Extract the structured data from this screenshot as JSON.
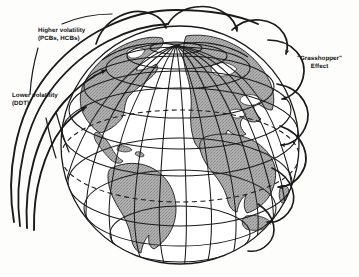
{
  "figure": {
    "background_color": "#ffffff",
    "ink_color": "#1a1a1a",
    "land_fill_color": "#a8a8a8",
    "ocean_fill_color": "#ffffff"
  },
  "annotations": {
    "higher_volatility": {
      "line1": "Higher volatility",
      "line2": "(PCBs, HCBs)"
    },
    "lower_volatility": {
      "line1": "Lower volatility",
      "line2": "(DDT)"
    },
    "grasshopper": {
      "line1": "\"Grasshopper\"",
      "line2": "Effect"
    }
  },
  "globe": {
    "center_x": 180,
    "center_y": 145,
    "radius": 119,
    "pole_x": 176,
    "pole_y": 45,
    "parallel_count": 7,
    "meridian_count": 12,
    "equator_dashed": true
  },
  "transport_arrows": {
    "long_sweeps_label": "long-range single-hop trajectories",
    "long_sweep_count": 4,
    "hop_arc_label": "multi-hop grasshopper arcs",
    "hop_arc_count": 8
  }
}
